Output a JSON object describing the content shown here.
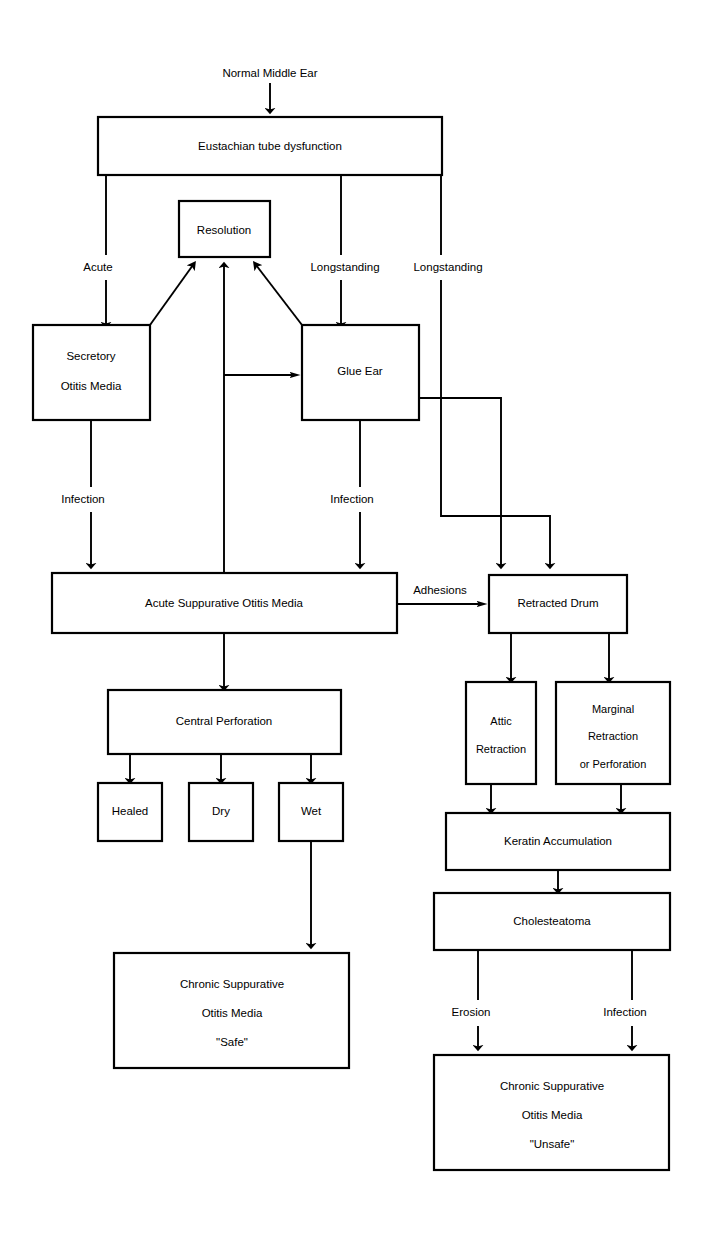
{
  "diagram": {
    "title": "Normal Middle Ear",
    "type": "flowchart",
    "background_color": "#ffffff",
    "line_color": "#000000",
    "node_fill": "#ffffff"
  },
  "nodes": {
    "normal_middle_ear": "Normal Middle Ear",
    "eustachian": "Eustachian tube dysfunction",
    "resolution": "Resolution",
    "secretory_line1": "Secretory",
    "secretory_line2": "Otitis Media",
    "glue_ear": "Glue Ear",
    "acute_supp": "Acute Suppurative Otitis Media",
    "retracted_drum": "Retracted Drum",
    "central_perforation": "Central Perforation",
    "attic_line1": "Attic",
    "attic_line2": "Retraction",
    "marginal_line1": "Marginal",
    "marginal_line2": "Retraction",
    "marginal_line3": "or Perforation",
    "healed": "Healed",
    "dry": "Dry",
    "wet": "Wet",
    "keratin": "Keratin Accumulation",
    "cholesteatoma": "Cholesteatoma",
    "csom_safe_line1": "Chronic Suppurative",
    "csom_safe_line2": "Otitis Media",
    "csom_safe_line3": "\"Safe\"",
    "csom_unsafe_line1": "Chronic Suppurative",
    "csom_unsafe_line2": "Otitis Media",
    "csom_unsafe_line3": "\"Unsafe\""
  },
  "edge_labels": {
    "acute": "Acute",
    "longstanding_1": "Longstanding",
    "longstanding_2": "Longstanding",
    "infection_1": "Infection",
    "infection_2": "Infection",
    "adhesions": "Adhesions",
    "erosion": "Erosion",
    "infection_3": "Infection"
  }
}
